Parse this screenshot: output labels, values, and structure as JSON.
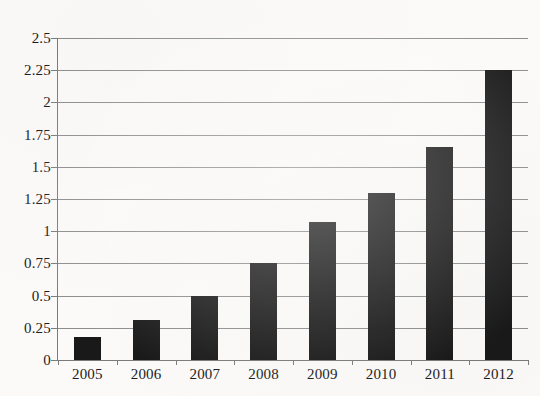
{
  "chart_data": {
    "type": "bar",
    "title": "",
    "subtitle": "",
    "xlabel": "",
    "ylabel": "",
    "categories": [
      "2005",
      "2006",
      "2007",
      "2008",
      "2009",
      "2010",
      "2011",
      "2012"
    ],
    "values": [
      0.18,
      0.31,
      0.5,
      0.75,
      1.07,
      1.3,
      1.65,
      2.25
    ],
    "series": [
      {
        "name": "",
        "values": [
          0.18,
          0.31,
          0.5,
          0.75,
          1.07,
          1.3,
          1.65,
          2.25
        ]
      }
    ],
    "ylim": [
      0,
      2.5
    ],
    "ytick_labels": [
      "0",
      "0.25",
      "0.5",
      "0.75",
      "1",
      "1.25",
      "1.5",
      "1.75",
      "2",
      "2.25",
      "2.5"
    ],
    "ytick_values": [
      0,
      0.25,
      0.5,
      0.75,
      1,
      1.25,
      1.5,
      1.75,
      2,
      2.25,
      2.5
    ],
    "grid": true,
    "grid_axis": "y",
    "legend": false,
    "legend_position": "none",
    "bar_color": "#191919",
    "gridline_color": "#8d8d8d",
    "axis_color": "#7c7c7c",
    "background_color": "#fbfaf8",
    "text_color": "#1d1d1d",
    "annotations": []
  }
}
